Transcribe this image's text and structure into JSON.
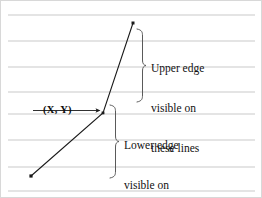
{
  "figure": {
    "background_color": "#ffffff",
    "border_color": "#d8d8d8",
    "scanlines": {
      "label": "horizontal scan lines",
      "color": "#c9c9c9",
      "count": 8,
      "x_start": 8,
      "x_end": 255,
      "y_positions": [
        15,
        41,
        67,
        92,
        114,
        140,
        167,
        191
      ]
    },
    "polyline": {
      "label": "polyline edge",
      "color": "#1a1a1a",
      "stroke_width": 1.1,
      "vertices": [
        {
          "x": 31,
          "y": 176,
          "name": "lower-endpoint",
          "marker": true
        },
        {
          "x": 103,
          "y": 113,
          "name": "shared-vertex",
          "marker": true
        },
        {
          "x": 133,
          "y": 23,
          "name": "upper-endpoint",
          "marker": true
        }
      ],
      "marker_size": 2.6
    },
    "vertex_label": {
      "text": "(X, Y)",
      "arrow": {
        "name": "pointer-arrow",
        "from_x": 33,
        "to_x": 99,
        "y": 110,
        "color": "#1a1a1a"
      }
    },
    "braces": {
      "upper": {
        "name": "upper-edge-brace",
        "x": 143,
        "y_top": 29,
        "y_bottom": 102,
        "color": "#5a5a5a"
      },
      "lower": {
        "name": "lower-edge-brace",
        "x": 116,
        "y_top": 105,
        "y_bottom": 178,
        "color": "#5a5a5a"
      }
    },
    "annotations": {
      "upper": {
        "name": "upper-edge-annotation",
        "lines": [
          "Upper edge",
          "visible on",
          "these lines"
        ]
      },
      "lower": {
        "name": "lower-edge-annotation",
        "lines": [
          "Lower edge",
          "visible on",
          "these lines"
        ]
      }
    }
  }
}
